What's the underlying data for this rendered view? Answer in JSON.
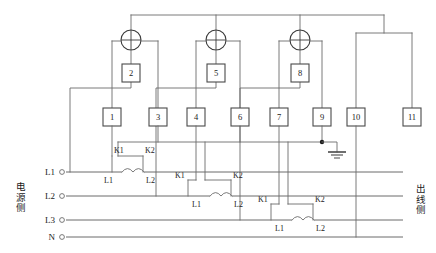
{
  "diagram": {
    "left_side_label": "电源侧",
    "right_side_label": "出线侧",
    "phases": [
      "L1",
      "L2",
      "L3",
      "N"
    ],
    "terminal_boxes": [
      {
        "id": "b1",
        "label": "1"
      },
      {
        "id": "b2",
        "label": "2"
      },
      {
        "id": "b3",
        "label": "3"
      },
      {
        "id": "b4",
        "label": "4"
      },
      {
        "id": "b5",
        "label": "5"
      },
      {
        "id": "b6",
        "label": "6"
      },
      {
        "id": "b7",
        "label": "7"
      },
      {
        "id": "b8",
        "label": "8"
      },
      {
        "id": "b9",
        "label": "9"
      },
      {
        "id": "b10",
        "label": "10"
      },
      {
        "id": "b11",
        "label": "11"
      }
    ],
    "ct_groups": [
      {
        "phase": "L1",
        "k1": "K1",
        "k2": "K2",
        "l1": "L1",
        "l2": "L2"
      },
      {
        "phase": "L2",
        "k1": "K1",
        "k2": "K2",
        "l1": "L1",
        "l2": "L2"
      },
      {
        "phase": "L3",
        "k1": "K1",
        "k2": "K2",
        "l1": "L1",
        "l2": "L2"
      }
    ],
    "meters": [
      {
        "id": "m1",
        "symbol": "crossed-circle"
      },
      {
        "id": "m2",
        "symbol": "crossed-circle"
      },
      {
        "id": "m3",
        "symbol": "crossed-circle"
      }
    ],
    "ground": {
      "symbol": "earth-ground"
    },
    "colors": {
      "wire": "#6b6b6b",
      "box_stroke": "#4a4a4a",
      "text": "#1a1a1a",
      "background": "#ffffff"
    }
  }
}
